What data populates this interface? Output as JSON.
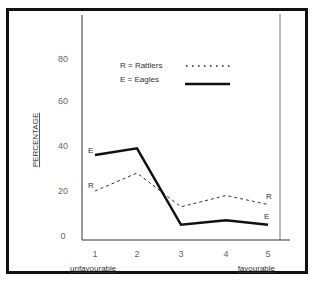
{
  "chart_data": {
    "type": "line",
    "title": "",
    "xlabel": "",
    "ylabel": "PERCENTAGE",
    "x": [
      1,
      2,
      3,
      4,
      5
    ],
    "categories": [
      "1",
      "2",
      "3",
      "4",
      "5"
    ],
    "x_annotations": {
      "left": "unfavourable",
      "right": "favourable"
    },
    "ylim": [
      0,
      80
    ],
    "yticks": [
      0,
      20,
      40,
      60,
      80
    ],
    "grid": false,
    "legend_position": "upper center",
    "legend": [
      {
        "key": "R",
        "label": "R = Rattlers",
        "style": "dotted"
      },
      {
        "key": "E",
        "label": "E = Eagles",
        "style": "solid-thick"
      }
    ],
    "series": [
      {
        "name": "Rattlers",
        "marker_label": "R",
        "style": "dashed",
        "values": [
          20,
          28,
          13,
          18,
          14
        ]
      },
      {
        "name": "Eagles",
        "marker_label": "E",
        "style": "solid",
        "values": [
          36,
          39,
          5,
          7,
          5
        ]
      }
    ]
  },
  "axis": {
    "y_ticks": [
      "0",
      "20",
      "40",
      "60",
      "80"
    ],
    "x_ticks": [
      "1",
      "2",
      "3",
      "4",
      "5"
    ],
    "ylabel": "PERCENTAGE",
    "left_note": "unfavourable",
    "right_note": "favourable"
  },
  "legend": {
    "rattlers": "R = Rattlers",
    "eagles": "E = Eagles"
  },
  "series_labels": {
    "r_start": "R",
    "r_end": "R",
    "e_start": "E",
    "e_end": "E"
  }
}
